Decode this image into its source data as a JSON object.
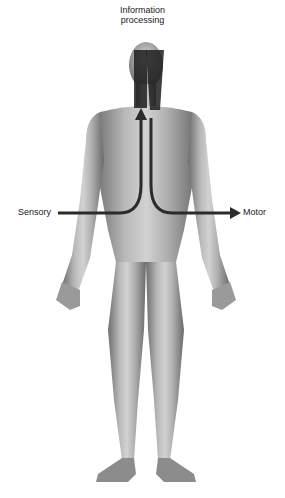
{
  "diagram": {
    "title_line1": "Information",
    "title_line2": "processing",
    "left_label": "Sensory",
    "right_label": "Motor",
    "arrows": [
      {
        "from": "Sensory",
        "to": "Information processing",
        "direction": "inward-up"
      },
      {
        "from": "Information processing",
        "to": "Motor",
        "direction": "down-outward"
      }
    ],
    "colors": {
      "arrow": "#2b2b2b",
      "skin_light": "#cfcfcf",
      "skin_dark": "#7a7a7a",
      "text": "#222222",
      "background": "#ffffff"
    }
  }
}
